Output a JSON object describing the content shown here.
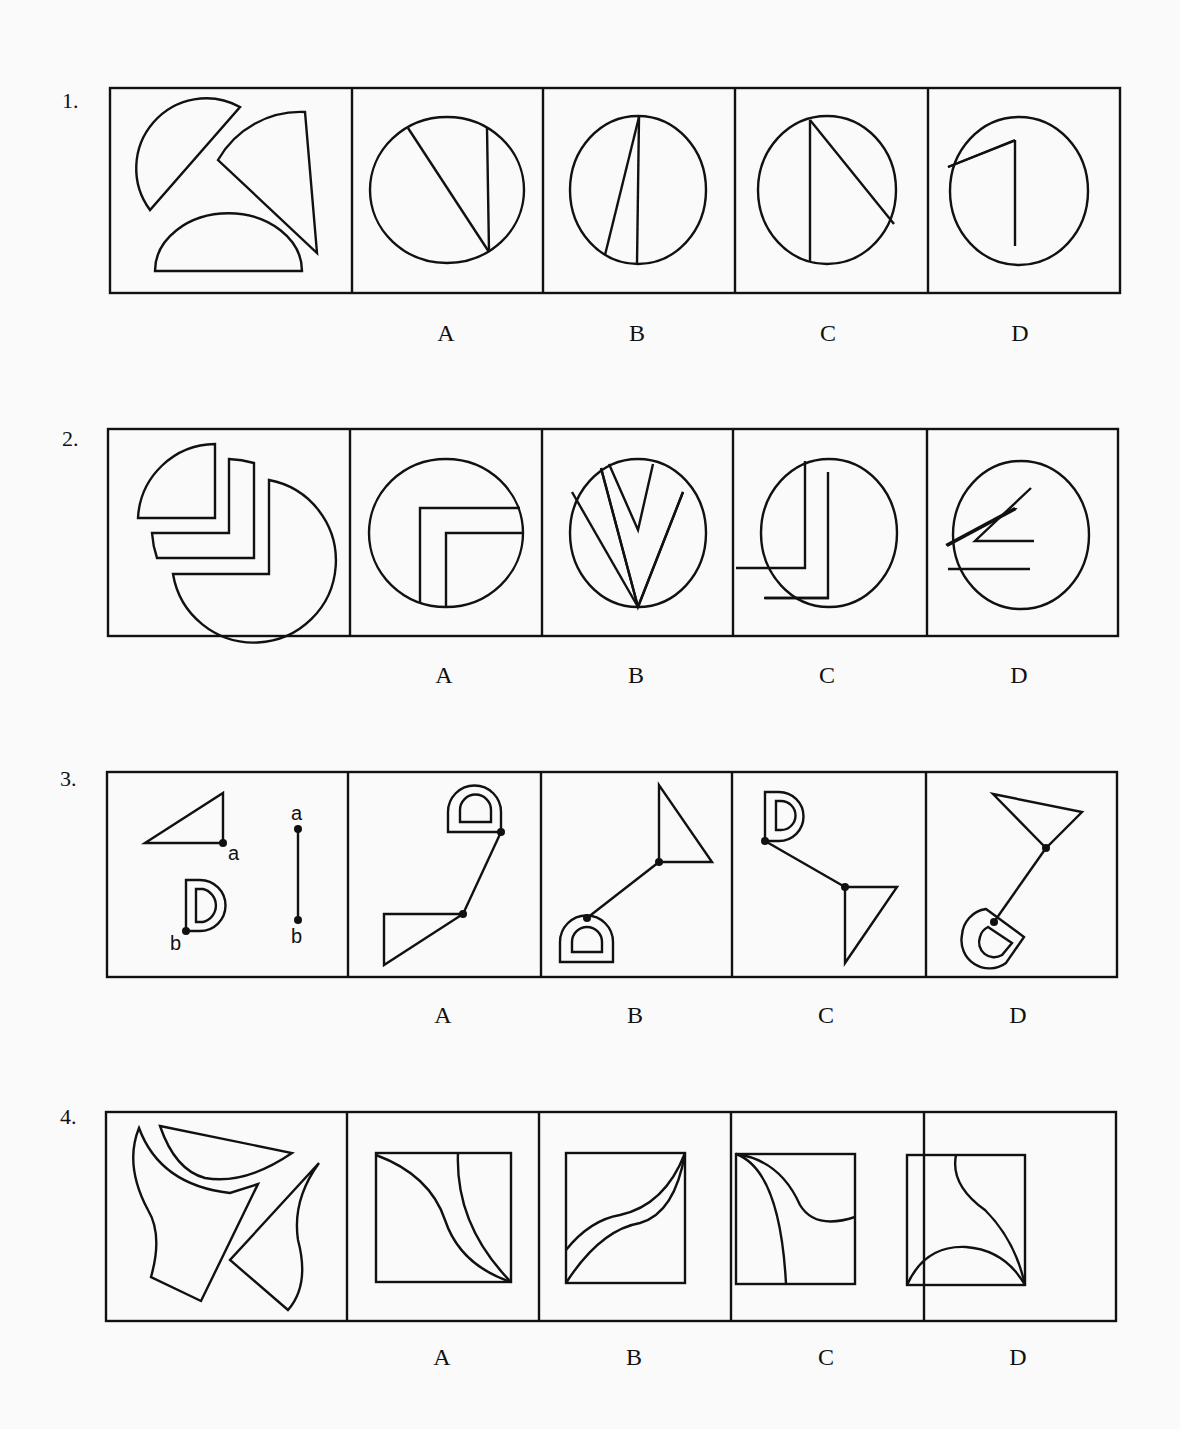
{
  "questions": [
    {
      "number": "1.",
      "options": [
        "A",
        "B",
        "C",
        "D"
      ]
    },
    {
      "number": "2.",
      "options": [
        "A",
        "B",
        "C",
        "D"
      ]
    },
    {
      "number": "3.",
      "options": [
        "A",
        "B",
        "C",
        "D"
      ],
      "point_labels": {
        "a": "a",
        "b": "b"
      }
    },
    {
      "number": "4.",
      "options": [
        "A",
        "B",
        "C",
        "D"
      ]
    }
  ],
  "colors": {
    "stroke": "#111111",
    "background": "#fafafa"
  }
}
